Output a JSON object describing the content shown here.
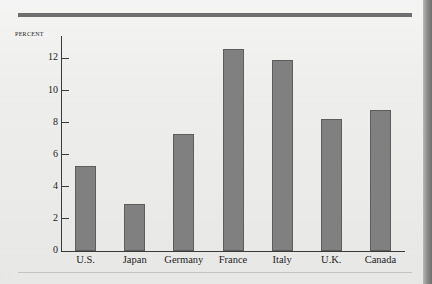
{
  "chart_data": {
    "type": "bar",
    "title": "",
    "xlabel": "",
    "ylabel": "Percent",
    "categories": [
      "U.S.",
      "Japan",
      "Germany",
      "France",
      "Italy",
      "U.K.",
      "Canada"
    ],
    "values": [
      5.3,
      2.9,
      7.3,
      12.6,
      11.9,
      8.2,
      8.8
    ],
    "ylim": [
      0,
      13.4
    ],
    "yticks": [
      0,
      2,
      4,
      6,
      8,
      10,
      12
    ],
    "ytick_labels": [
      "0",
      "2",
      "4",
      "6",
      "8",
      "10",
      "12"
    ],
    "grid": false,
    "legend": null,
    "bar_color": "#808080",
    "bar_edge_color": "#5d5d5d",
    "axis_color": "#3a3a3a",
    "background_color": "#ececeb",
    "rule_color": "#6e6e6e"
  }
}
